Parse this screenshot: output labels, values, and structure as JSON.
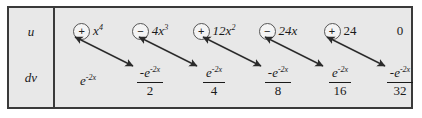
{
  "table": {
    "row_labels": {
      "u": "u",
      "dv": "dv"
    },
    "u_row": [
      {
        "sign": "+",
        "sign_icon": "circled-plus-icon",
        "coefficient": "",
        "base": "x",
        "exponent": "4",
        "text": "x⁴"
      },
      {
        "sign": "−",
        "sign_icon": "circled-minus-icon",
        "coefficient": "4",
        "base": "x",
        "exponent": "3",
        "text": "4x³"
      },
      {
        "sign": "+",
        "sign_icon": "circled-plus-icon",
        "coefficient": "12",
        "base": "x",
        "exponent": "2",
        "text": "12x²"
      },
      {
        "sign": "−",
        "sign_icon": "circled-minus-icon",
        "coefficient": "24",
        "base": "x",
        "exponent": "",
        "text": "24x"
      },
      {
        "sign": "+",
        "sign_icon": "circled-plus-icon",
        "coefficient": "24",
        "base": "",
        "exponent": "",
        "text": "24"
      },
      {
        "sign": "",
        "sign_icon": "",
        "coefficient": "0",
        "base": "",
        "exponent": "",
        "text": "0"
      }
    ],
    "dv_row": [
      {
        "numerator_sign": "",
        "numerator": "e",
        "exponent": "-2x",
        "denominator": ""
      },
      {
        "numerator_sign": "-",
        "numerator": "e",
        "exponent": "-2x",
        "denominator": "2"
      },
      {
        "numerator_sign": "",
        "numerator": "e",
        "exponent": "-2x",
        "denominator": "4"
      },
      {
        "numerator_sign": "-",
        "numerator": "e",
        "exponent": "-2x",
        "denominator": "8"
      },
      {
        "numerator_sign": "",
        "numerator": "e",
        "exponent": "-2x",
        "denominator": "16"
      },
      {
        "numerator_sign": "-",
        "numerator": "e",
        "exponent": "-2x",
        "denominator": "32"
      }
    ],
    "arrows": [
      {
        "name": "arrow-1",
        "from_column": 0,
        "to_column": 1
      },
      {
        "name": "arrow-2",
        "from_column": 1,
        "to_column": 2
      },
      {
        "name": "arrow-3",
        "from_column": 2,
        "to_column": 3
      },
      {
        "name": "arrow-4",
        "from_column": 3,
        "to_column": 4
      },
      {
        "name": "arrow-5",
        "from_column": 4,
        "to_column": 5
      }
    ],
    "colors": {
      "background": "#e8e8e8",
      "border": "#3a3a3a",
      "text": "#1a1a1a",
      "arrow": "#2b2b2b",
      "page": "#ffffff"
    }
  }
}
